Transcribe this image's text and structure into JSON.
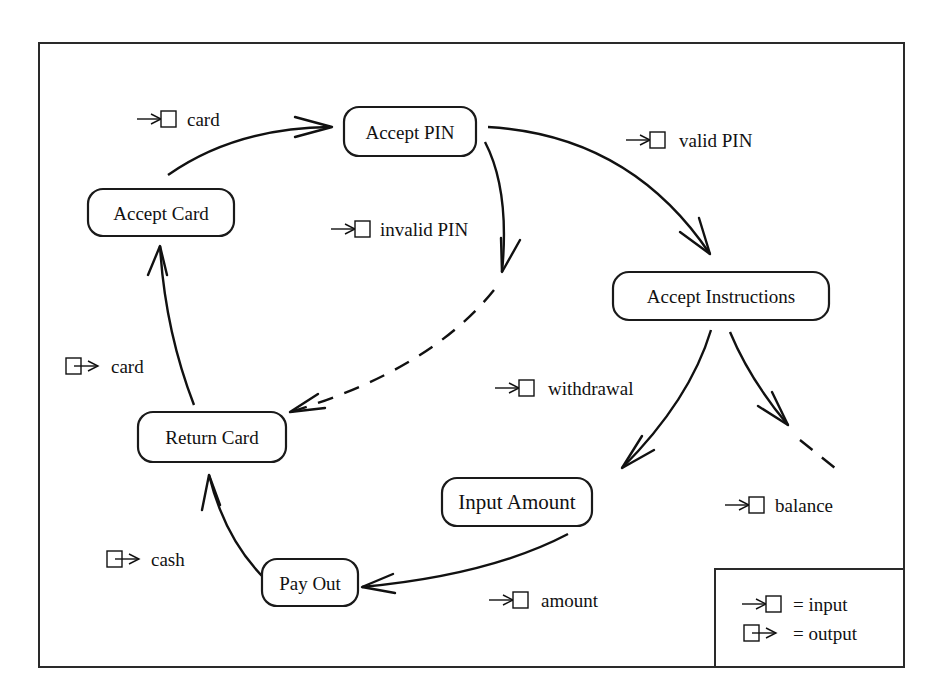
{
  "diagram": {
    "states": [
      {
        "id": "accept_card",
        "label": "Accept Card"
      },
      {
        "id": "accept_pin",
        "label": "Accept PIN"
      },
      {
        "id": "accept_instructions",
        "label": "Accept Instructions"
      },
      {
        "id": "input_amount",
        "label": "Input Amount"
      },
      {
        "id": "pay_out",
        "label": "Pay Out"
      },
      {
        "id": "return_card",
        "label": "Return Card"
      }
    ],
    "transitions": [
      {
        "from": "accept_card",
        "to": "accept_pin",
        "kind": "input",
        "label": "card",
        "style": "solid"
      },
      {
        "from": "accept_pin",
        "to": "accept_instructions",
        "kind": "input",
        "label": "valid PIN",
        "style": "solid"
      },
      {
        "from": "accept_pin",
        "to": "return_card",
        "kind": "input",
        "label": "invalid PIN",
        "style": "dashed"
      },
      {
        "from": "accept_instructions",
        "to": "input_amount",
        "kind": "input",
        "label": "withdrawal",
        "style": "solid"
      },
      {
        "from": "accept_instructions",
        "to": "(continues)",
        "kind": "input",
        "label": "balance",
        "style": "dashed"
      },
      {
        "from": "input_amount",
        "to": "pay_out",
        "kind": "input",
        "label": "amount",
        "style": "solid"
      },
      {
        "from": "pay_out",
        "to": "return_card",
        "kind": "output",
        "label": "cash",
        "style": "solid"
      },
      {
        "from": "return_card",
        "to": "accept_card",
        "kind": "output",
        "label": "card",
        "style": "solid"
      }
    ],
    "legend": {
      "input": "= input",
      "output": "= output"
    }
  }
}
